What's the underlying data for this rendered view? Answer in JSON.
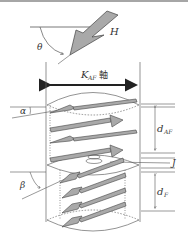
{
  "diagram": {
    "field": {
      "label": "H",
      "angle_label": "θ"
    },
    "axis": {
      "label_main": "K",
      "label_sub": "AF",
      "label_suffix": "軸"
    },
    "upper_layer": {
      "angle_label": "α",
      "thickness_main": "d",
      "thickness_sub": "AF",
      "arrow_count": 4
    },
    "interface": {
      "label": "J"
    },
    "lower_layer": {
      "angle_label": "β",
      "thickness_main": "d",
      "thickness_sub": "F",
      "arrow_count": 4
    },
    "colors": {
      "line": "#555555",
      "arrow_fill": "#a9a9a9",
      "arrow_stroke": "#444444",
      "border_top": "#888888"
    }
  }
}
